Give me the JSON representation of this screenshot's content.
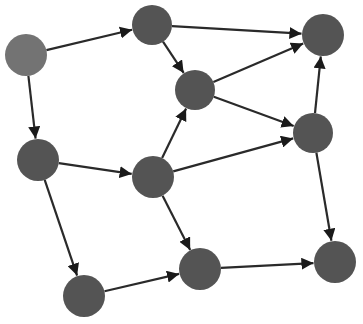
{
  "diagram": {
    "type": "directed-graph",
    "width": 363,
    "height": 324,
    "colors": {
      "background": "#ffffff",
      "node_default": "#545454",
      "node_source": "#737373",
      "edge": "#2a2a2a"
    },
    "nodes": [
      {
        "id": "n0",
        "x": 26,
        "y": 55,
        "r": 21,
        "role": "source"
      },
      {
        "id": "n1",
        "x": 152,
        "y": 25,
        "r": 20,
        "role": "default"
      },
      {
        "id": "n2",
        "x": 195,
        "y": 90,
        "r": 20,
        "role": "default"
      },
      {
        "id": "n3",
        "x": 323,
        "y": 35,
        "r": 21,
        "role": "default"
      },
      {
        "id": "n4",
        "x": 313,
        "y": 133,
        "r": 20,
        "role": "default"
      },
      {
        "id": "n5",
        "x": 38,
        "y": 160,
        "r": 21,
        "role": "default"
      },
      {
        "id": "n6",
        "x": 153,
        "y": 177,
        "r": 21,
        "role": "default"
      },
      {
        "id": "n7",
        "x": 84,
        "y": 296,
        "r": 21,
        "role": "default"
      },
      {
        "id": "n8",
        "x": 200,
        "y": 269,
        "r": 21,
        "role": "default"
      },
      {
        "id": "n9",
        "x": 335,
        "y": 262,
        "r": 21,
        "role": "default"
      }
    ],
    "edges": [
      {
        "from": "n0",
        "to": "n1"
      },
      {
        "from": "n0",
        "to": "n5"
      },
      {
        "from": "n1",
        "to": "n3"
      },
      {
        "from": "n1",
        "to": "n2"
      },
      {
        "from": "n2",
        "to": "n3"
      },
      {
        "from": "n2",
        "to": "n4"
      },
      {
        "from": "n4",
        "to": "n3"
      },
      {
        "from": "n4",
        "to": "n9"
      },
      {
        "from": "n5",
        "to": "n6"
      },
      {
        "from": "n5",
        "to": "n7"
      },
      {
        "from": "n6",
        "to": "n2"
      },
      {
        "from": "n6",
        "to": "n4"
      },
      {
        "from": "n6",
        "to": "n8"
      },
      {
        "from": "n7",
        "to": "n8"
      },
      {
        "from": "n8",
        "to": "n9"
      }
    ]
  }
}
